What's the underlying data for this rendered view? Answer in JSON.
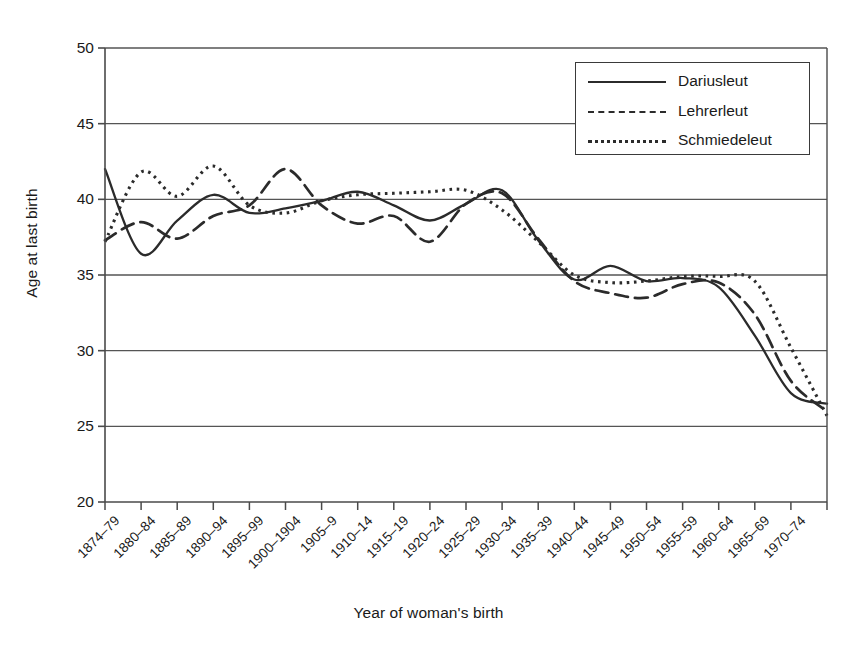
{
  "chart_data": {
    "type": "line",
    "title": "",
    "xlabel": "Year of woman's birth",
    "ylabel": "Age at last birth",
    "ylim": [
      20,
      50
    ],
    "yticks": [
      50,
      45,
      40,
      35,
      30,
      25,
      20
    ],
    "ytick_labels": [
      "50",
      "45",
      "40",
      "35",
      "30",
      "25",
      "20"
    ],
    "grid": true,
    "grid_axis": "y",
    "legend_position": "top-right",
    "legend_entries": [
      {
        "label": "Dariusleut",
        "style": "solid"
      },
      {
        "label": "Lehrerleut",
        "style": "dashed"
      },
      {
        "label": "Schmiedeleut",
        "style": "dotted"
      }
    ],
    "categories": [
      "1874–79",
      "1880–84",
      "1885–89",
      "1890–94",
      "1895–99",
      "1900–1904",
      "1905–9",
      "1910–14",
      "1915–19",
      "1920–24",
      "1925–29",
      "1930–34",
      "1935–39",
      "1940–44",
      "1945–49",
      "1950–54",
      "1955–59",
      "1960–64",
      "1965–69",
      "1970–74",
      ""
    ],
    "series": [
      {
        "name": "Dariusleut",
        "style": "solid",
        "color": "#2b2b2b",
        "values": [
          42.0,
          36.4,
          38.6,
          40.3,
          39.1,
          39.4,
          39.9,
          40.5,
          39.6,
          38.6,
          39.7,
          40.6,
          37.3,
          34.7,
          35.6,
          34.6,
          34.8,
          34.2,
          31.0,
          27.2,
          26.5
        ]
      },
      {
        "name": "Lehrerleut",
        "style": "dashed",
        "color": "#2b2b2b",
        "values": [
          37.3,
          38.5,
          37.4,
          38.9,
          39.6,
          42.0,
          39.6,
          38.4,
          38.9,
          37.2,
          39.7,
          40.4,
          37.4,
          34.6,
          33.8,
          33.5,
          34.4,
          34.5,
          32.4,
          28.0,
          26.0
        ]
      },
      {
        "name": "Schmiedeleut",
        "style": "dotted",
        "color": "#2b2b2b",
        "values": [
          37.2,
          41.8,
          40.2,
          42.2,
          39.6,
          39.1,
          39.9,
          40.3,
          40.4,
          40.5,
          40.6,
          39.3,
          37.2,
          35.0,
          34.5,
          34.6,
          34.9,
          34.9,
          34.6,
          30.2,
          25.7
        ]
      }
    ]
  },
  "figure": {
    "plot_left": 105,
    "plot_right": 827,
    "plot_top": 48,
    "plot_bottom": 502,
    "background": "#ffffff",
    "axis_color": "#4a4a4a",
    "grid_color": "#555555"
  }
}
